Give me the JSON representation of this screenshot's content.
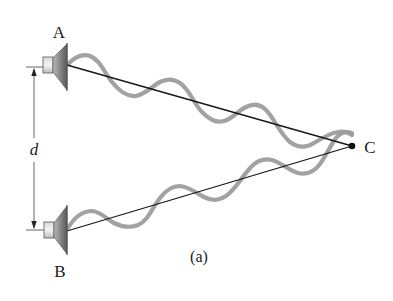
{
  "figure": {
    "caption": "(a)"
  },
  "labels": {
    "source_a": "A",
    "source_b": "B",
    "point_c": "C",
    "separation": "d"
  },
  "colors": {
    "wave": "#9a9a9a",
    "ray": "#161616",
    "speaker_body": "#8a8a8a",
    "background": "#ffffff"
  }
}
